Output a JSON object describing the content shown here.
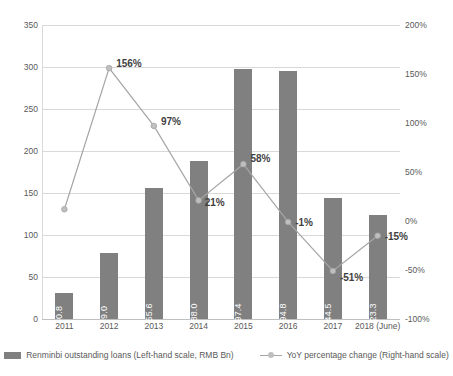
{
  "chart_data": {
    "type": "bar",
    "title": "",
    "subtitle": "",
    "xlabel": "",
    "ylabel": "",
    "categories": [
      "2011",
      "2012",
      "2013",
      "2014",
      "2015",
      "2016",
      "2017",
      "2018 (June)"
    ],
    "grid": true,
    "legend_position": "bottom",
    "left_axis": {
      "label": "Renminbi outstanding loans (Left-hand scale, RMB Bn)",
      "min": 0,
      "max": 350,
      "step": 50,
      "ticks": [
        "0",
        "50",
        "100",
        "150",
        "200",
        "250",
        "300",
        "350"
      ]
    },
    "right_axis": {
      "label": "YoY percentage change (Right-hand scale)",
      "min": -100,
      "max": 200,
      "step": 50,
      "ticks": [
        "-100%",
        "-50%",
        "0%",
        "50%",
        "100%",
        "150%",
        "200%"
      ]
    },
    "series": [
      {
        "name": "Renminbi outstanding loans (Left-hand scale, RMB Bn)",
        "type": "bar",
        "axis": "left",
        "color": "#808080",
        "values": [
          30.8,
          79.0,
          155.6,
          188.0,
          297.4,
          294.8,
          144.5,
          123.3
        ],
        "data_labels": [
          "30.8",
          "79.0",
          "155.6",
          "188.0",
          "297.4",
          "294.8",
          "144.5",
          "123.3"
        ]
      },
      {
        "name": "YoY percentage change (Right-hand scale)",
        "type": "line",
        "axis": "right",
        "color": "#a6a6a6",
        "values": [
          12,
          156,
          97,
          21,
          58,
          -1,
          -51,
          -15
        ],
        "data_labels": [
          "",
          "156%",
          "97%",
          "21%",
          "58%",
          "-1%",
          "-51%",
          "-15%"
        ]
      }
    ]
  },
  "legend": {
    "items": [
      {
        "label": "Renminbi outstanding loans (Left-hand scale, RMB Bn)",
        "marker": "bar-swatch"
      },
      {
        "label": "YoY percentage change (Right-hand scale)",
        "marker": "line-marker-swatch"
      }
    ]
  }
}
